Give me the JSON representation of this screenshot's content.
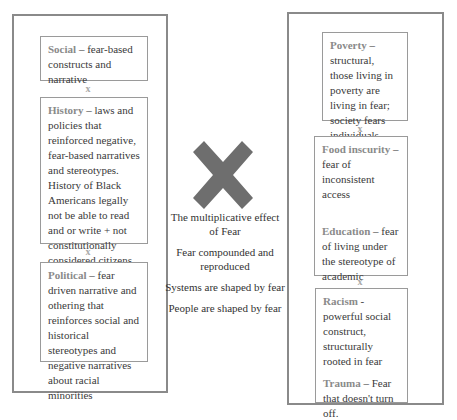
{
  "left_panel": {
    "boxes": [
      {
        "label": "Social",
        "text": " – fear-based constructs and narrative"
      },
      {
        "label": "History",
        "text": " – laws and policies that reinforced negative, fear-based narratives and stereotypes. History of Black Americans legally not be able to read and or write + not constitutionally considered citizens until 1868"
      },
      {
        "label": "Political",
        "text": " – fear driven narrative and othering that reinforces social and historical stereotypes and negative narratives about racial minorities"
      }
    ],
    "separator": "x"
  },
  "center": {
    "icon": "multiply-x-icon",
    "icon_color": "#6e6e6e",
    "lines": [
      "The multiplicative effect of Fear",
      "Fear compounded and reproduced",
      "Systems are shaped by fear",
      "People are shaped by fear"
    ]
  },
  "right_panel": {
    "boxes": [
      {
        "items": [
          {
            "label": "Poverty",
            "text": " – structural, those living in poverty are living in fear; society fears individuals living in poverty"
          }
        ]
      },
      {
        "items": [
          {
            "label": "Food inscurity",
            "text": " – fear of inconsistent access"
          },
          {
            "label": "Education",
            "text": " – fear of living under the stereotype of academic underachievement"
          }
        ]
      },
      {
        "items": [
          {
            "label": "Racism",
            "text": " - powerful social construct, structurally rooted in fear"
          },
          {
            "label": "Trauma",
            "text": " – Fear that doesn't turn off."
          }
        ]
      }
    ],
    "separator": "x"
  }
}
